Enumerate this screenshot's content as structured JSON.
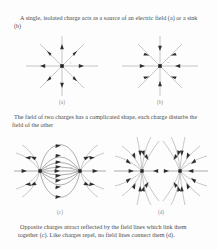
{
  "figure": {
    "captions": {
      "top": "A single, isolated charge acts as a source of an electric field (a) or a sink (b)",
      "middle": "The field of two charges has a complicated shape, each charge disturbs the field of the other",
      "bottom": "Opposite charges attract reflected by the field lines which link them together (c).  Like charges repel, no field lines connect them (d)."
    },
    "panels": [
      {
        "id": "a",
        "label": "(a)",
        "description": "single positive point charge, eight straight radial field lines with arrowheads pointing outward",
        "charge_signs": [
          "+"
        ],
        "line_count": 8,
        "flow": "outward"
      },
      {
        "id": "b",
        "label": "(b)",
        "description": "single negative point charge, eight straight radial field lines with arrowheads pointing inward",
        "charge_signs": [
          "-"
        ],
        "line_count": 8,
        "flow": "inward"
      },
      {
        "id": "c",
        "label": "(c)",
        "description": "electric dipole, curved field lines leave the positive charge on the left and terminate on the negative charge on the right",
        "charge_signs": [
          "+",
          "-"
        ],
        "flow": "left-to-right"
      },
      {
        "id": "d",
        "label": "(d)",
        "description": "two like negative charges, field lines curve inward to each charge and no lines connect the pair",
        "charge_signs": [
          "-",
          "-"
        ],
        "flow": "inward-both"
      }
    ],
    "colors": {
      "page_background": "#fdfdfd",
      "text": "#4a4a4a",
      "field_line": "#9a9a9a",
      "arrow": "#2e2e2e",
      "charge_marker": "#262626",
      "panel_label": "#8c8c8c"
    }
  }
}
